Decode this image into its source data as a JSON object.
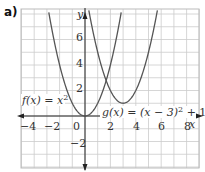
{
  "panel_label": "a)",
  "chart_data": {
    "type": "line",
    "title": "",
    "xlabel": "x",
    "ylabel": "y",
    "xlim": [
      -5,
      9
    ],
    "ylim": [
      -4,
      8.5
    ],
    "grid": true,
    "x_ticks": [
      -4,
      -2,
      0,
      2,
      4,
      6,
      8
    ],
    "y_ticks": [
      -2,
      2,
      4,
      6
    ],
    "series": [
      {
        "name": "f(x) = x²",
        "expression": "x^2",
        "vertex": [
          0,
          0
        ]
      },
      {
        "name": "g(x) = (x − 3)² + 1",
        "expression": "(x-3)^2+1",
        "vertex": [
          3,
          1
        ]
      }
    ],
    "annotations": [
      {
        "text": "f(x) = x²",
        "x": -4.8,
        "y": 1.2
      },
      {
        "text": "g(x) = (x − 3)² + 1",
        "x": 1.9,
        "y": 0.3
      }
    ],
    "colors": {
      "curve": "#555555",
      "grid": "#c8c8c8",
      "axis": "#222222"
    }
  },
  "labels": {
    "x_axis": "x",
    "y_axis": "y",
    "x_ticks": [
      "−4",
      "−2",
      "0",
      "2",
      "4",
      "6",
      "8"
    ],
    "y_ticks": [
      "6",
      "4",
      "2",
      "−2"
    ],
    "f_label": "f(x) = x",
    "f_sup": "2",
    "g_label": "g(x) = (x − 3)",
    "g_sup": "2",
    "g_tail": " + 1"
  }
}
